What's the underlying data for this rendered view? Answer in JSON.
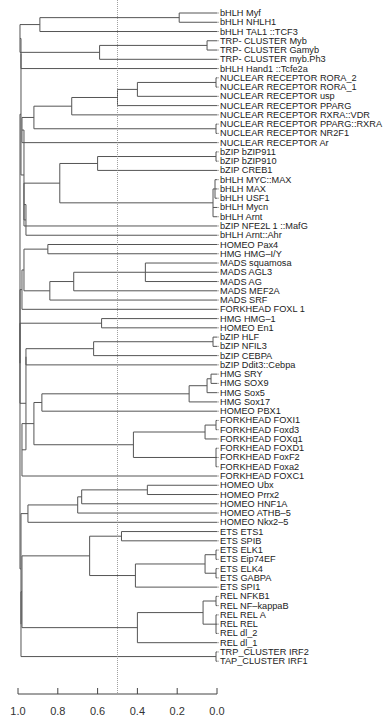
{
  "chart_data": {
    "type": "dendrogram",
    "orientation": "horizontal",
    "title": "",
    "xlabel": "",
    "ylabel": "",
    "xlim": [
      1.0,
      0.0
    ],
    "x_ticks": [
      "1.0",
      "0.8",
      "0.6",
      "0.4",
      "0.2",
      "0.0"
    ],
    "cutoff_line": 0.5,
    "leaves": [
      "bHLH Myf",
      "bHLH NHLH1",
      "bHLH TAL1 ::TCF3",
      "TRP- CLUSTER Myb",
      "TRP- CLUSTER Gamyb",
      "TRP- CLUSTER myb.Ph3",
      "bHLH Hand1 ::Tcfe2a",
      "NUCLEAR RECEPTOR RORA_2",
      "NUCLEAR RECEPTOR RORA_1",
      "NUCLEAR RECEPTOR usp",
      "NUCLEAR RECEPTOR PPARG",
      "NUCLEAR RECEPTOR RXRA::VDR",
      "NUCLEAR RECEPTOR PPARG::RXRA",
      "NUCLEAR RECEPTOR NR2F1",
      "NUCLEAR RECEPTOR Ar",
      "bZIP bZIP911",
      "bZIP bZIP910",
      "bZIP CREB1",
      "bHLH MYC::MAX",
      "bHLH MAX",
      "bHLH USF1",
      "bHLH Mycn",
      "bHLH Arnt",
      "bZIP NFE2L 1 ::MafG",
      "bHLH Arnt::Ahr",
      "HOMEO Pax4",
      "HMG HMG–I/Y",
      "MADS squamosa",
      "MADS AGL3",
      "MADS AG",
      "MADS MEF2A",
      "MADS SRF",
      "FORKHEAD FOXL 1",
      "HMG HMG–1",
      "HOMEO En1",
      "bZIP HLF",
      "bZIP NFIL3",
      "bZIP CEBPA",
      "bZIP Ddit3::Cebpa",
      "HMG SRY",
      "HMG SOX9",
      "HMG Sox5",
      "HMG Sox17",
      "HOMEO PBX1",
      "FORKHEAD FOXI1",
      "FORKHEAD Foxd3",
      "FORKHEAD FOXq1",
      "FORKHEAD FOXD1",
      "FORKHEAD FoxF2",
      "FORKHEAD Foxa2",
      "FORKHEAD FOXC1",
      "HOMEO Ubx",
      "HOMEO Prrx2",
      "HOMEO HNF1A",
      "HOMEO ATHB–5",
      "HOMEO Nkx2–5",
      "ETS ETS1",
      "ETS SPIB",
      "ETS ELK1",
      "ETS Eip74EF",
      "ETS ELK4",
      "ETS GABPA",
      "ETS SPI1",
      "REL NFKB1",
      "REL NF–kappaB",
      "REL REL A",
      "REL REL",
      "REL dl_2",
      "REL dl_1",
      "TRP_CLUSTER IRF2",
      "TAP_CLUSTER IRF1"
    ],
    "tree": {
      "h": 0.99,
      "c": [
        {
          "h": 0.985,
          "c": [
            {
              "h": 0.985,
              "c": [
                {
                  "h": 0.99,
                  "c": [
                    {
                      "h": 0.89,
                      "c": [
                        {
                          "h": 0.19,
                          "c": [
                            0,
                            1
                          ]
                        },
                        2
                      ]
                    },
                    {
                      "h": 0.59,
                      "c": [
                        {
                          "h": 0.05,
                          "c": [
                            3,
                            4
                          ]
                        },
                        5
                      ]
                    }
                  ]
                },
                6
              ]
            },
            {
              "h": 0.97,
              "c": [
                {
                  "h": 0.98,
                  "c": [
                    {
                      "h": 0.92,
                      "c": [
                        {
                          "h": 0.73,
                          "c": [
                            {
                              "h": 0.5,
                              "c": [
                                {
                                  "h": 0.4,
                                  "c": [
                                    {
                                      "h": 0.005,
                                      "c": [
                                        7,
                                        8
                                      ]
                                    },
                                    9
                                  ]
                                },
                                10
                              ]
                            },
                            11
                          ]
                        },
                        {
                          "h": 0.005,
                          "c": [
                            12,
                            13
                          ]
                        }
                      ]
                    },
                    14
                  ]
                },
                {
                  "h": 0.96,
                  "c": [
                    {
                      "h": 0.97,
                      "c": [
                        {
                          "h": 0.79,
                          "c": [
                            {
                              "h": 0.6,
                              "c": [
                                {
                                  "h": 0.005,
                                  "c": [
                                    15,
                                    16
                                  ]
                                },
                                17
                              ]
                            },
                            {
                              "h": 0.02,
                              "c": [
                                {
                                  "h": 0.01,
                                  "c": [
                                    18,
                                    19,
                                    20
                                  ]
                                },
                                21,
                                22
                              ]
                            }
                          ]
                        },
                        23
                      ]
                    },
                    24
                  ]
                }
              ]
            }
          ]
        },
        {
          "h": 0.99,
          "c": [
            {
              "h": 0.98,
              "c": [
                {
                  "h": 0.97,
                  "c": [
                    {
                      "h": 0.85,
                      "c": [
                        25,
                        26
                      ]
                    },
                    {
                      "h": 0.84,
                      "c": [
                        {
                          "h": 0.72,
                          "c": [
                            {
                              "h": 0.36,
                              "c": [
                                27,
                                28,
                                29
                              ]
                            },
                            30
                          ]
                        },
                        31
                      ]
                    }
                  ]
                },
                32
              ]
            },
            {
              "h": 0.99,
              "c": [
                {
                  "h": 0.58,
                  "c": [
                    33,
                    34
                  ]
                },
                {
                  "h": 0.96,
                  "c": [
                    {
                      "h": 0.96,
                      "c": [
                        {
                          "h": 0.62,
                          "c": [
                            {
                              "h": 0.02,
                              "c": [
                                35,
                                36
                              ]
                            },
                            37
                          ]
                        },
                        38
                      ]
                    },
                    {
                      "h": 0.98,
                      "c": [
                        {
                          "h": 0.92,
                          "c": [
                            {
                              "h": 0.88,
                              "c": [
                                {
                                  "h": 0.14,
                                  "c": [
                                    {
                                      "h": 0.05,
                                      "c": [
                                        {
                                          "h": 0.03,
                                          "c": [
                                            39,
                                            40
                                          ]
                                        },
                                        41
                                      ]
                                    },
                                    42
                                  ]
                                },
                                43
                              ]
                            },
                            {
                              "h": 0.42,
                              "c": [
                                {
                                  "h": 0.06,
                                  "c": [
                                    {
                                      "h": 0.005,
                                      "c": [
                                        44,
                                        45
                                      ]
                                    },
                                    46
                                  ]
                                },
                                {
                                  "h": 0.005,
                                  "c": [
                                    47,
                                    48,
                                    49
                                  ]
                                }
                              ]
                            }
                          ]
                        },
                        50
                      ]
                    }
                  ]
                }
              ]
            }
          ]
        },
        {
          "h": 0.985,
          "c": [
            {
              "h": 0.95,
              "c": [
                {
                  "h": 0.7,
                  "c": [
                    {
                      "h": 0.68,
                      "c": [
                        {
                          "h": 0.35,
                          "c": [
                            51,
                            52
                          ]
                        },
                        53
                      ]
                    },
                    54
                  ]
                },
                55
              ]
            },
            {
              "h": 0.985,
              "c": [
                {
                  "h": 0.98,
                  "c": [
                    {
                      "h": 0.64,
                      "c": [
                        {
                          "h": 0.48,
                          "c": [
                            56,
                            57
                          ]
                        },
                        {
                          "h": 0.41,
                          "c": [
                            {
                              "h": 0.06,
                              "c": [
                                {
                                  "h": 0.005,
                                  "c": [
                                    58,
                                    59
                                  ]
                                },
                                {
                                  "h": 0.005,
                                  "c": [
                                    60,
                                    61
                                  ]
                                }
                              ]
                            },
                            62
                          ]
                        }
                      ]
                    },
                    {
                      "h": 0.4,
                      "c": [
                        {
                          "h": 0.07,
                          "c": [
                            {
                              "h": 0.005,
                              "c": [
                                63,
                                64
                              ]
                            },
                            {
                              "h": 0.005,
                              "c": [
                                65,
                                66,
                                67
                              ]
                            }
                          ]
                        },
                        68
                      ]
                    }
                  ]
                },
                {
                  "h": 0.005,
                  "c": [
                    69,
                    70
                  ]
                }
              ]
            }
          ]
        }
      ]
    }
  },
  "layout": {
    "x_at_1": 18,
    "x_at_0": 217,
    "first_leaf_y": 13,
    "leaf_spacing": 9.26,
    "axis_y": 694,
    "line_color": "#555555",
    "cutoff_color": "#888888"
  }
}
